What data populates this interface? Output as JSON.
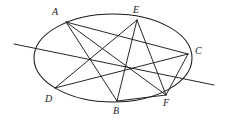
{
  "figure": {
    "stroke_color": "#1b1b1b",
    "background_color": "#ffffff",
    "width": 225,
    "height": 130
  },
  "conic": {
    "name": "ellipse",
    "center_x": 113,
    "center_y": 58,
    "radius_x": 79,
    "radius_y": 44,
    "rotation_deg": 0
  },
  "vertices": [
    {
      "id": "A",
      "label": "A",
      "x": 66,
      "y": 22,
      "label_x": 52,
      "label_y": 7
    },
    {
      "id": "B",
      "label": "B",
      "x": 117,
      "y": 101,
      "label_x": 113,
      "label_y": 106
    },
    {
      "id": "C",
      "label": "C",
      "x": 188,
      "y": 54,
      "label_x": 195,
      "label_y": 46
    },
    {
      "id": "D",
      "label": "D",
      "x": 55,
      "y": 88,
      "label_x": 45,
      "label_y": 94
    },
    {
      "id": "E",
      "label": "E",
      "x": 137,
      "y": 20,
      "label_x": 133,
      "label_y": 5
    },
    {
      "id": "F",
      "label": "F",
      "x": 166,
      "y": 95,
      "label_x": 163,
      "label_y": 98
    }
  ],
  "chords": [
    {
      "id": "AB",
      "from": "A",
      "to": "B"
    },
    {
      "id": "AC",
      "from": "A",
      "to": "C"
    },
    {
      "id": "AF",
      "from": "A",
      "to": "F"
    },
    {
      "id": "BE",
      "from": "B",
      "to": "E"
    },
    {
      "id": "BF",
      "from": "B",
      "to": "F"
    },
    {
      "id": "CD",
      "from": "C",
      "to": "D"
    },
    {
      "id": "CF",
      "from": "C",
      "to": "F"
    },
    {
      "id": "DE",
      "from": "D",
      "to": "E"
    },
    {
      "id": "EF",
      "from": "E",
      "to": "F"
    }
  ],
  "pascal_line": {
    "id": "pascal-line",
    "x1": 14,
    "y1": 44,
    "x2": 214,
    "y2": 85
  }
}
